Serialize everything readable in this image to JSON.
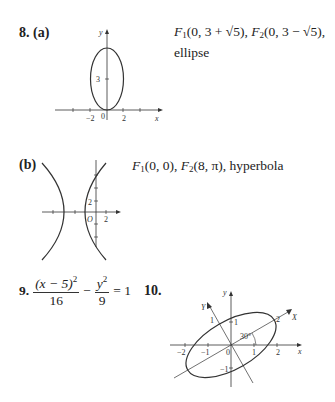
{
  "problems": [
    {
      "number": "8.",
      "part": "(a)",
      "answer_f1": "F",
      "answer_f1_sub": "1",
      "answer_f1_rest": "(0, 3 + √5), ",
      "answer_f2": "F",
      "answer_f2_sub": "2",
      "answer_f2_rest": "(0, 3 − √5),",
      "answer_line2": "ellipse",
      "graph": {
        "axis_x": "x",
        "axis_y": "y",
        "ticks_x": [
          "−2",
          "0",
          "2"
        ],
        "ticks_y": [
          "3"
        ]
      }
    },
    {
      "part": "(b)",
      "answer_f1": "F",
      "answer_f1_sub": "1",
      "answer_f1_rest": "(0, 0), ",
      "answer_f2": "F",
      "answer_f2_sub": "2",
      "answer_f2_rest": "(8, π), hyperbola",
      "graph": {
        "origin": "O",
        "ticks_x": [
          "2"
        ],
        "ticks_y": [
          "2"
        ]
      }
    },
    {
      "number": "9.",
      "num_numerator": "(x − 5)",
      "num_exp": "2",
      "num_denominator": "16",
      "minus": "−",
      "y_numerator": "y",
      "y_exp": "2",
      "y_denominator": "9",
      "equals": "= 1"
    },
    {
      "number": "10.",
      "graph": {
        "axis_x": "x",
        "axis_y": "y",
        "rot_x": "X",
        "rot_y": "Y",
        "angle": "30°",
        "ticks_x": [
          "−2",
          "−1",
          "0",
          "1",
          "2"
        ],
        "ticks_y": [
          "1",
          "−1"
        ],
        "rot_ticks": [
          "1",
          "2"
        ]
      }
    }
  ]
}
